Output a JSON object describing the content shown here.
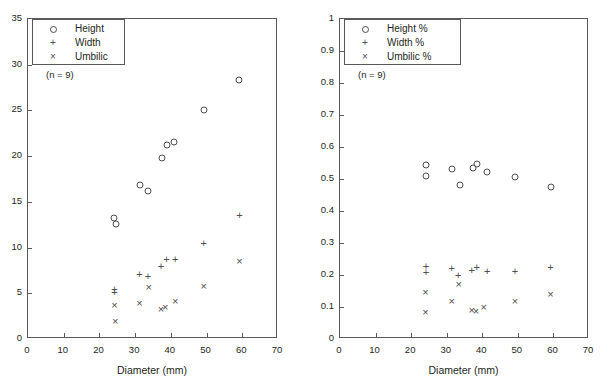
{
  "figure": {
    "background": "#ffffff",
    "ink": "#231f20",
    "axis_color": "#58595b",
    "marker_color": "#4d4d4f"
  },
  "chart_data": [
    {
      "type": "scatter",
      "panel": "left",
      "title": "",
      "xlabel": "Diameter (mm)",
      "ylabel": "",
      "xlim": [
        0,
        70
      ],
      "ylim": [
        0,
        35
      ],
      "xticks": [
        0,
        10,
        20,
        30,
        40,
        50,
        60,
        70
      ],
      "yticks": [
        0,
        5,
        10,
        15,
        20,
        25,
        30,
        35
      ],
      "xticklabels": [
        "0",
        "10",
        "20",
        "30",
        "40",
        "50",
        "60",
        "70"
      ],
      "yticklabels": [
        "0",
        "5",
        "10",
        "15",
        "20",
        "25",
        "30",
        "35"
      ],
      "grid": false,
      "legend_position": "upper-left",
      "annotation": "(n = 9)",
      "series": [
        {
          "name": "Height",
          "marker": "circle",
          "points": [
            [
              24.0,
              13.2
            ],
            [
              24.6,
              12.6
            ],
            [
              31.4,
              16.8
            ],
            [
              33.6,
              16.2
            ],
            [
              37.4,
              19.8
            ],
            [
              38.8,
              21.2
            ],
            [
              41.0,
              21.6
            ],
            [
              49.2,
              25.0
            ],
            [
              59.2,
              28.3
            ]
          ]
        },
        {
          "name": "Width",
          "marker": "plus",
          "points": [
            [
              24.2,
              5.5
            ],
            [
              24.2,
              5.1
            ],
            [
              31.2,
              7.1
            ],
            [
              33.6,
              6.9
            ],
            [
              37.2,
              8.0
            ],
            [
              38.8,
              8.7
            ],
            [
              41.2,
              8.8
            ],
            [
              49.2,
              10.5
            ],
            [
              59.2,
              13.6
            ]
          ]
        },
        {
          "name": "Umbilic",
          "marker": "cross",
          "points": [
            [
              24.2,
              3.7
            ],
            [
              24.4,
              2.0
            ],
            [
              31.2,
              3.9
            ],
            [
              33.8,
              5.7
            ],
            [
              37.2,
              3.3
            ],
            [
              38.4,
              3.5
            ],
            [
              41.2,
              4.2
            ],
            [
              49.2,
              5.8
            ],
            [
              59.2,
              8.5
            ]
          ]
        }
      ]
    },
    {
      "type": "scatter",
      "panel": "right",
      "title": "",
      "xlabel": "Diameter (mm)",
      "ylabel": "",
      "xlim": [
        0,
        70
      ],
      "ylim": [
        0,
        1
      ],
      "xticks": [
        0,
        10,
        20,
        30,
        40,
        50,
        60,
        70
      ],
      "yticks": [
        0,
        0.1,
        0.2,
        0.3,
        0.4,
        0.5,
        0.6,
        0.7,
        0.8,
        0.9,
        1
      ],
      "xticklabels": [
        "0",
        "10",
        "20",
        "30",
        "40",
        "50",
        "60",
        "70"
      ],
      "yticklabels": [
        "0",
        "0.1",
        "0.2",
        "0.3",
        "0.4",
        "0.5",
        "0.6",
        "0.7",
        "0.8",
        "0.9",
        "1"
      ],
      "grid": false,
      "legend_position": "upper-left",
      "annotation": "(n = 9)",
      "series": [
        {
          "name": "Height %",
          "marker": "circle",
          "points": [
            [
              24.2,
              0.545
            ],
            [
              24.2,
              0.51
            ],
            [
              31.4,
              0.53
            ],
            [
              33.8,
              0.48
            ],
            [
              37.4,
              0.535
            ],
            [
              38.4,
              0.548
            ],
            [
              41.4,
              0.522
            ],
            [
              49.2,
              0.506
            ],
            [
              59.2,
              0.476
            ]
          ]
        },
        {
          "name": "Width %",
          "marker": "plus",
          "points": [
            [
              24.2,
              0.228
            ],
            [
              24.2,
              0.208
            ],
            [
              31.4,
              0.221
            ],
            [
              33.2,
              0.201
            ],
            [
              37.0,
              0.216
            ],
            [
              38.4,
              0.224
            ],
            [
              41.4,
              0.211
            ],
            [
              49.2,
              0.212
            ],
            [
              59.2,
              0.225
            ]
          ]
        },
        {
          "name": "Umbilic %",
          "marker": "cross",
          "points": [
            [
              24.0,
              0.146
            ],
            [
              24.0,
              0.084
            ],
            [
              31.4,
              0.119
            ],
            [
              33.4,
              0.171
            ],
            [
              37.0,
              0.09
            ],
            [
              38.2,
              0.089
            ],
            [
              40.4,
              0.1
            ],
            [
              49.2,
              0.119
            ],
            [
              59.2,
              0.141
            ]
          ]
        }
      ]
    }
  ]
}
